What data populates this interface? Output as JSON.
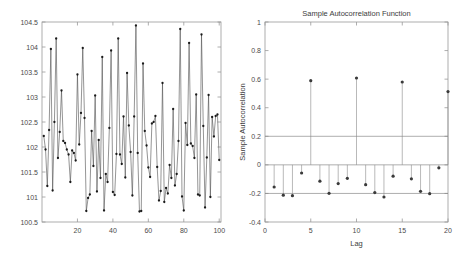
{
  "figure": {
    "background": "#ffffff",
    "panels": [
      "timeseries-plot",
      "autocorrelation-plot"
    ]
  },
  "chart_data": [
    {
      "type": "line",
      "name": "timeseries-plot",
      "title": "",
      "xlabel": "",
      "ylabel": "",
      "xlim": [
        0,
        101
      ],
      "ylim": [
        100.5,
        104.5
      ],
      "xticks": [
        20,
        40,
        60,
        80,
        100
      ],
      "xticklabels": [
        "20",
        "40",
        "60",
        "80",
        "100"
      ],
      "yticks": [
        100.5,
        101,
        101.5,
        102,
        102.5,
        103,
        103.5,
        104,
        104.5
      ],
      "yticklabels": [
        "100.5",
        "101",
        "101.5",
        "102",
        "102.5",
        "103",
        "103.5",
        "104",
        "104.5"
      ],
      "grid": false,
      "marker": "dot",
      "line_color": "#4d4d4d",
      "marker_color": "#1a1a1a",
      "x": [
        1,
        2,
        3,
        4,
        5,
        6,
        7,
        8,
        9,
        10,
        11,
        12,
        13,
        14,
        15,
        16,
        17,
        18,
        19,
        20,
        21,
        22,
        23,
        24,
        25,
        26,
        27,
        28,
        29,
        30,
        31,
        32,
        33,
        34,
        35,
        36,
        37,
        38,
        39,
        40,
        41,
        42,
        43,
        44,
        45,
        46,
        47,
        48,
        49,
        50,
        51,
        52,
        53,
        54,
        55,
        56,
        57,
        58,
        59,
        60,
        61,
        62,
        63,
        64,
        65,
        66,
        67,
        68,
        69,
        70,
        71,
        72,
        73,
        74,
        75,
        76,
        77,
        78,
        79,
        80,
        81,
        82,
        83,
        84,
        85,
        86,
        87,
        88,
        89,
        90,
        91,
        92,
        93,
        94,
        95,
        96,
        97,
        98,
        99,
        100
      ],
      "values": [
        102.22,
        101.95,
        101.22,
        102.34,
        103.96,
        101.13,
        102.5,
        104.17,
        101.78,
        102.3,
        103.13,
        102.12,
        102.08,
        101.95,
        101.85,
        101.3,
        101.93,
        101.88,
        101.73,
        103.45,
        102.05,
        102.68,
        103.98,
        102.58,
        100.72,
        100.98,
        101.05,
        102.32,
        101.62,
        103.03,
        101.11,
        102.14,
        101.38,
        103.8,
        100.73,
        101.46,
        101.3,
        102.38,
        103.93,
        101.1,
        101.04,
        101.86,
        104.17,
        101.85,
        101.66,
        102.61,
        101.39,
        103.48,
        102.43,
        101.9,
        101.03,
        102.61,
        104.43,
        101.88,
        100.71,
        100.72,
        103.67,
        102.32,
        102.03,
        101.59,
        101.4,
        102.47,
        102.5,
        102.62,
        101.6,
        100.93,
        101.12,
        103.28,
        100.9,
        101.18,
        101.07,
        101.64,
        101.38,
        102.76,
        101.23,
        101.46,
        102.12,
        104.36,
        101.01,
        100.73,
        102.48,
        102.04,
        104.08,
        102.07,
        102.02,
        101.78,
        103.05,
        101.05,
        101.03,
        104.25,
        102.42,
        100.79,
        101.79,
        103.04,
        101.0,
        102.6,
        102.21,
        102.62,
        102.65,
        101.74
      ]
    },
    {
      "type": "scatter",
      "name": "autocorrelation-plot",
      "title": "Sample Autocorrelation Function",
      "xlabel": "Lag",
      "ylabel": "Sample Autocorrelation",
      "xlim": [
        0,
        20
      ],
      "ylim": [
        -0.4,
        1
      ],
      "xticks": [
        0,
        5,
        10,
        15,
        20
      ],
      "xticklabels": [
        "0",
        "5",
        "10",
        "15",
        "20"
      ],
      "yticks": [
        -0.4,
        -0.2,
        0,
        0.2,
        0.4,
        0.6,
        0.8,
        1
      ],
      "yticklabels": [
        "-0.4",
        "-0.2",
        "0",
        "0.2",
        "0.4",
        "0.6",
        "0.8",
        "1"
      ],
      "grid": false,
      "lags": [
        1,
        2,
        3,
        4,
        5,
        6,
        7,
        8,
        9,
        10,
        11,
        12,
        13,
        14,
        15,
        16,
        17,
        18,
        19,
        20
      ],
      "values": [
        -0.155,
        -0.212,
        -0.216,
        -0.057,
        0.589,
        -0.114,
        -0.199,
        -0.131,
        -0.094,
        0.608,
        -0.139,
        -0.194,
        -0.225,
        -0.079,
        0.58,
        -0.098,
        -0.185,
        -0.202,
        -0.021,
        0.513
      ],
      "confidence_bounds": [
        0.2,
        -0.2
      ],
      "zero_line": 0,
      "stem_color": "#8a8a8a",
      "marker_color": "#3a3a3a",
      "bound_color": "#8a8a8a"
    }
  ]
}
